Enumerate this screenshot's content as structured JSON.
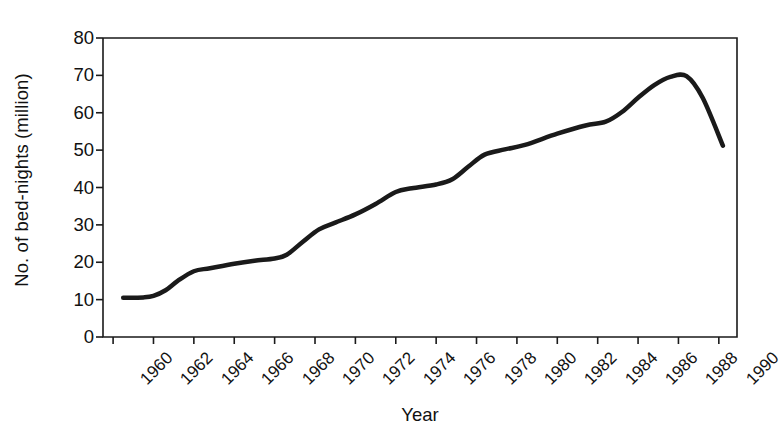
{
  "chart_data": {
    "type": "line",
    "title": "",
    "xlabel": "Year",
    "ylabel": "No. of bed-nights (million)",
    "xlim": [
      1959.5,
      1990.9
    ],
    "ylim": [
      0,
      80
    ],
    "yticks": [
      0,
      10,
      20,
      30,
      40,
      50,
      60,
      70,
      80
    ],
    "ytick_labels": [
      "0",
      "10",
      "20",
      "30",
      "40",
      "50",
      "60",
      "70",
      "80"
    ],
    "xticks": [
      1960,
      1962,
      1964,
      1966,
      1968,
      1970,
      1972,
      1974,
      1976,
      1978,
      1980,
      1982,
      1984,
      1986,
      1988,
      1990
    ],
    "xtick_labels": [
      "1960",
      "1962",
      "1964",
      "1966",
      "1968",
      "1970",
      "1972",
      "1974",
      "1976",
      "1978",
      "1980",
      "1982",
      "1984",
      "1986",
      "1988",
      "1990"
    ],
    "grid": false,
    "legend": false,
    "line_color": "#1a1a1a",
    "line_width": 4.5,
    "series": [
      {
        "name": "No. of bed-nights (million)",
        "x": [
          1960.5,
          1961.5,
          1962.0,
          1962.6,
          1963.2,
          1964.0,
          1964.8,
          1966.0,
          1967.0,
          1968.0,
          1968.6,
          1969.4,
          1970.2,
          1971.0,
          1972.0,
          1973.0,
          1974.0,
          1974.8,
          1976.0,
          1976.8,
          1977.6,
          1978.4,
          1979.4,
          1980.4,
          1982.0,
          1983.4,
          1984.4,
          1985.2,
          1986.0,
          1986.8,
          1987.6,
          1988.4,
          1989.2,
          1990.2
        ],
        "y": [
          10.5,
          10.6,
          11.0,
          12.5,
          15.0,
          17.6,
          18.4,
          19.6,
          20.4,
          21.0,
          22.0,
          25.5,
          28.8,
          30.6,
          32.8,
          35.6,
          38.8,
          39.8,
          40.8,
          42.2,
          45.6,
          48.8,
          50.2,
          51.4,
          54.4,
          56.6,
          57.6,
          60.2,
          64.0,
          67.4,
          69.6,
          69.8,
          64.0,
          51.2
        ]
      }
    ]
  }
}
